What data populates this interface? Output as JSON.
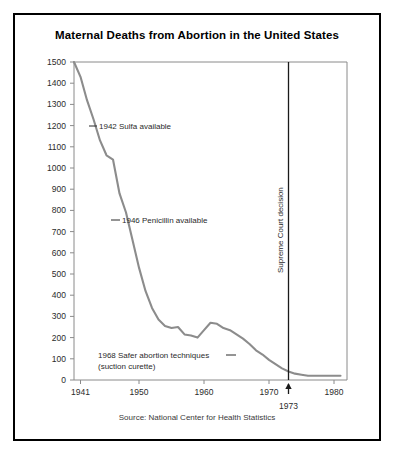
{
  "figure": {
    "title": "Maternal Deaths from Abortion in the United States",
    "source": "Source: National Center for Health Statistics"
  },
  "annotations": {
    "sulfa": "1942 Sulfa available",
    "penicillin": "1946 Penicillin available",
    "safer_line1": "1968 Safer abortion techniques",
    "safer_line2": "(suction curette)",
    "supreme_court": "Supreme Court decision",
    "supreme_court_year": "1973"
  },
  "chart_data": {
    "type": "line",
    "title": "Maternal Deaths from Abortion in the United States",
    "xlabel": "",
    "ylabel": "",
    "xlim": [
      1940,
      1982
    ],
    "ylim": [
      0,
      1500
    ],
    "ytick_step": 100,
    "grid": false,
    "legend": "none",
    "line_color": "#8c8c8c",
    "xticks": [
      "1941",
      "1950",
      "1960",
      "1970",
      "1980"
    ],
    "xtick_values": [
      1941,
      1950,
      1960,
      1970,
      1980
    ],
    "yticks": [
      "0",
      "100",
      "200",
      "300",
      "400",
      "500",
      "600",
      "700",
      "800",
      "900",
      "1000",
      "1100",
      "1200",
      "1300",
      "1400",
      "1500"
    ],
    "ytick_values": [
      0,
      100,
      200,
      300,
      400,
      500,
      600,
      700,
      800,
      900,
      1000,
      1100,
      1200,
      1300,
      1400,
      1500
    ],
    "x": [
      1940,
      1941,
      1942,
      1943,
      1944,
      1945,
      1946,
      1947,
      1948,
      1949,
      1950,
      1951,
      1952,
      1953,
      1954,
      1955,
      1956,
      1957,
      1958,
      1959,
      1960,
      1961,
      1962,
      1963,
      1964,
      1965,
      1966,
      1967,
      1968,
      1969,
      1970,
      1971,
      1972,
      1973,
      1974,
      1975,
      1976,
      1977,
      1978,
      1979,
      1980,
      1981
    ],
    "values": [
      1500,
      1430,
      1320,
      1230,
      1130,
      1060,
      1040,
      880,
      790,
      660,
      530,
      420,
      340,
      285,
      255,
      245,
      250,
      215,
      210,
      200,
      235,
      270,
      265,
      245,
      235,
      215,
      195,
      170,
      140,
      120,
      95,
      75,
      55,
      40,
      30,
      25,
      20,
      20,
      20,
      20,
      20,
      20
    ],
    "annotations": [
      {
        "label": "1942 Sulfa available",
        "year": 1942,
        "value": 1230
      },
      {
        "label": "1946 Penicillin available",
        "year": 1946,
        "value": 790
      },
      {
        "label": "1968 Safer abortion techniques (suction curette)",
        "year": 1968,
        "value": 140
      },
      {
        "label": "Supreme Court decision",
        "year": 1973,
        "value": null
      }
    ],
    "event_line": {
      "label": "Supreme Court decision",
      "year": 1973
    }
  }
}
